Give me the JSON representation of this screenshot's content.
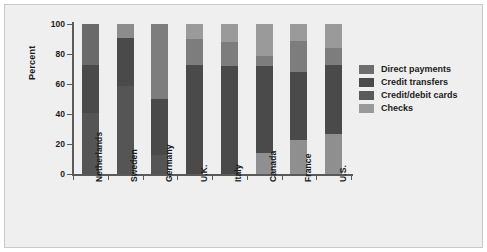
{
  "chart": {
    "ylabel": "Percent",
    "yticks": [
      "0",
      "20",
      "40",
      "60",
      "80",
      "100"
    ]
  },
  "legend": {
    "items": [
      {
        "label": "Direct payments",
        "color": "#6e6e6e"
      },
      {
        "label": "Credit transfers",
        "color": "#4a4a4a"
      },
      {
        "label": "Credit/debit cards",
        "color": "#5a5a5a"
      },
      {
        "label": "Checks",
        "color": "#9a9a9a"
      }
    ]
  },
  "chart_data": {
    "type": "bar",
    "subtype": "stacked-bar",
    "title": "",
    "xlabel": "",
    "ylabel": "Percent",
    "ylim": [
      0,
      100
    ],
    "yticks": [
      0,
      20,
      40,
      60,
      80,
      100
    ],
    "grid": false,
    "legend_position": "right",
    "categories": [
      "Netherlands",
      "Sweden",
      "Germany",
      "U.K.",
      "Italy",
      "Canada",
      "France",
      "U.S."
    ],
    "series": [
      {
        "name": "Direct payments",
        "color": "#6e6e6e",
        "values": [
          41,
          0,
          13,
          0,
          0,
          0,
          0,
          0
        ]
      },
      {
        "name": "Credit transfers",
        "color": "#4a4a4a",
        "values": [
          32,
          91,
          37,
          73,
          72,
          58,
          68,
          57
        ]
      },
      {
        "name": "Credit/debit cards",
        "color": "#5a5a5a",
        "values": [
          27,
          9,
          50,
          17,
          16,
          21,
          9,
          16
        ]
      },
      {
        "name": "Checks",
        "color": "#9a9a9a",
        "values": [
          0,
          0,
          0,
          10,
          12,
          21,
          23,
          27
        ]
      }
    ]
  },
  "bars": [
    {
      "label": "Netherlands",
      "segments": [
        {
          "name": "Checks",
          "value": 0,
          "color": "#9a9a9a"
        },
        {
          "name": "Credit/debit cards",
          "value": 27,
          "color": "#6a6a6a"
        },
        {
          "name": "Credit transfers",
          "value": 32,
          "color": "#4a4a4a"
        },
        {
          "name": "Direct payments",
          "value": 41,
          "color": "#555555"
        }
      ]
    },
    {
      "label": "Sweden",
      "segments": [
        {
          "name": "Checks",
          "value": 0,
          "color": "#9a9a9a"
        },
        {
          "name": "Credit/debit cards",
          "value": 9,
          "color": "#8c8c8c"
        },
        {
          "name": "Credit transfers",
          "value": 32,
          "color": "#4a4a4a"
        },
        {
          "name": "Direct payments",
          "value": 59,
          "color": "#555555"
        }
      ]
    },
    {
      "label": "Germany",
      "segments": [
        {
          "name": "Checks",
          "value": 0,
          "color": "#9a9a9a"
        },
        {
          "name": "Credit/debit cards",
          "value": 50,
          "color": "#7d7d7d"
        },
        {
          "name": "Credit transfers",
          "value": 37,
          "color": "#4a4a4a"
        },
        {
          "name": "Direct payments",
          "value": 13,
          "color": "#555555"
        }
      ]
    },
    {
      "label": "U.K.",
      "segments": [
        {
          "name": "Checks",
          "value": 10,
          "color": "#9a9a9a"
        },
        {
          "name": "Credit/debit cards",
          "value": 17,
          "color": "#7d7d7d"
        },
        {
          "name": "Credit transfers",
          "value": 73,
          "color": "#4a4a4a"
        },
        {
          "name": "Direct payments",
          "value": 0,
          "color": "#555555"
        }
      ]
    },
    {
      "label": "Italy",
      "segments": [
        {
          "name": "Checks",
          "value": 12,
          "color": "#9a9a9a"
        },
        {
          "name": "Credit/debit cards",
          "value": 16,
          "color": "#7d7d7d"
        },
        {
          "name": "Credit transfers",
          "value": 72,
          "color": "#4a4a4a"
        },
        {
          "name": "Direct payments",
          "value": 0,
          "color": "#555555"
        }
      ]
    },
    {
      "label": "Canada",
      "segments": [
        {
          "name": "Checks",
          "value": 21,
          "color": "#9a9a9a"
        },
        {
          "name": "Credit/debit cards",
          "value": 7,
          "color": "#7d7d7d"
        },
        {
          "name": "Credit transfers",
          "value": 58,
          "color": "#4a4a4a"
        },
        {
          "name": "Direct payments",
          "value": 14,
          "color": "#8f8f8f"
        }
      ]
    },
    {
      "label": "France",
      "segments": [
        {
          "name": "Checks",
          "value": 11,
          "color": "#9a9a9a"
        },
        {
          "name": "Credit/debit cards",
          "value": 21,
          "color": "#7d7d7d"
        },
        {
          "name": "Credit transfers",
          "value": 45,
          "color": "#4a4a4a"
        },
        {
          "name": "Direct payments",
          "value": 23,
          "color": "#8f8f8f"
        }
      ]
    },
    {
      "label": "U.S.",
      "segments": [
        {
          "name": "Checks",
          "value": 16,
          "color": "#9a9a9a"
        },
        {
          "name": "Credit/debit cards",
          "value": 11,
          "color": "#7d7d7d"
        },
        {
          "name": "Credit transfers",
          "value": 46,
          "color": "#4a4a4a"
        },
        {
          "name": "Direct payments",
          "value": 27,
          "color": "#8f8f8f"
        }
      ]
    }
  ]
}
